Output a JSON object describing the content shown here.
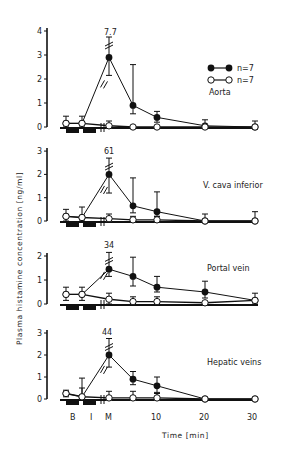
{
  "chart_data": {
    "type": "line",
    "ylabel": "Plasma histamine concentration [ng/ml]",
    "xlabel": "Time [min]",
    "x_tick_labels": [
      "B",
      "I",
      "M",
      "10",
      "20",
      "30"
    ],
    "x": [
      "B1",
      "B2",
      "M",
      "5",
      "10",
      "20",
      "30"
    ],
    "legend": [
      {
        "marker": "filled-circle",
        "label": "n=7"
      },
      {
        "marker": "open-circle",
        "label": "n=7"
      }
    ],
    "panels": [
      {
        "name": "Aorta",
        "ylim": [
          0,
          4
        ],
        "yticks": [
          "0",
          "1",
          "2",
          "3",
          "4"
        ],
        "peak_annotation": "7.7",
        "series": [
          {
            "name": "filled n=7",
            "values": [
              0.15,
              0.15,
              2.9,
              0.9,
              0.4,
              0.05,
              0.0
            ],
            "err_up": [
              0.3,
              0.3,
              0.85,
              1.7,
              0.25,
              0.25,
              0.25
            ],
            "err_down": [
              0.15,
              0.15,
              0.75,
              0.35,
              0.2,
              0.1,
              0.1
            ]
          },
          {
            "name": "open n=7",
            "values": [
              0.15,
              0.15,
              0.05,
              0.0,
              0.0,
              0.0,
              0.0
            ],
            "err_up": [
              0.0,
              0.0,
              0.2,
              0.0,
              0.0,
              0.0,
              0.0
            ],
            "err_down": [
              0.0,
              0.0,
              0.05,
              0.0,
              0.05,
              0.0,
              0.0
            ]
          }
        ]
      },
      {
        "name": "V. cava inferior",
        "ylim": [
          0,
          3
        ],
        "yticks": [
          "0",
          "1",
          "2",
          "3"
        ],
        "peak_annotation": "61",
        "series": [
          {
            "name": "filled n=7",
            "values": [
              0.2,
              0.15,
              2.0,
              0.65,
              0.4,
              0.0,
              0.0
            ],
            "err_up": [
              0.3,
              0.45,
              0.7,
              1.2,
              0.85,
              0.3,
              0.4
            ],
            "err_down": [
              0.2,
              0.15,
              0.8,
              0.3,
              0.2,
              0.05,
              0.05
            ]
          },
          {
            "name": "open n=7",
            "values": [
              0.2,
              0.15,
              0.1,
              0.05,
              0.05,
              0.0,
              0.0
            ],
            "err_up": [
              0.0,
              0.0,
              0.2,
              0.15,
              0.15,
              0.0,
              0.0
            ],
            "err_down": [
              0.0,
              0.0,
              0.1,
              0.05,
              0.05,
              0.0,
              0.0
            ]
          }
        ]
      },
      {
        "name": "Portal vein",
        "ylim": [
          0,
          2
        ],
        "yticks": [
          "0",
          "1",
          "2"
        ],
        "peak_annotation": "34",
        "series": [
          {
            "name": "filled n=7",
            "values": [
              0.4,
              0.4,
              1.45,
              1.15,
              0.7,
              0.5,
              0.15
            ],
            "err_up": [
              0.3,
              0.3,
              0.7,
              0.8,
              0.45,
              0.45,
              0.3
            ],
            "err_down": [
              0.25,
              0.25,
              0.3,
              0.4,
              0.2,
              0.25,
              0.15
            ]
          },
          {
            "name": "open n=7",
            "values": [
              0.4,
              0.4,
              0.2,
              0.1,
              0.1,
              0.05,
              0.15
            ],
            "err_up": [
              0.0,
              0.0,
              0.25,
              0.2,
              0.2,
              0.05,
              0.0
            ],
            "err_down": [
              0.0,
              0.0,
              0.2,
              0.1,
              0.1,
              0.05,
              0.0
            ]
          }
        ]
      },
      {
        "name": "Hepatic veins",
        "ylim": [
          0,
          3
        ],
        "yticks": [
          "0",
          "1",
          "2",
          "3"
        ],
        "peak_annotation": "44",
        "series": [
          {
            "name": "filled n=7",
            "values": [
              0.25,
              0.1,
              2.0,
              0.9,
              0.6,
              0.0,
              0.0
            ],
            "err_up": [
              0.15,
              0.4,
              0.75,
              0.35,
              0.4,
              0.0,
              0.0
            ],
            "err_down": [
              0.15,
              0.1,
              0.55,
              0.25,
              0.3,
              0.0,
              0.0
            ]
          },
          {
            "name": "open n=7",
            "values": [
              0.25,
              0.1,
              0.05,
              0.05,
              0.05,
              0.0,
              0.0
            ],
            "err_up": [
              0.0,
              0.85,
              0.3,
              0.3,
              0.2,
              0.0,
              0.0
            ],
            "err_down": [
              0.0,
              0.1,
              0.05,
              0.05,
              0.05,
              0.0,
              0.0
            ]
          }
        ]
      }
    ]
  },
  "labels": {
    "ylabel": "Plasma histamine concentration [ng/ml]",
    "xlabel": "Time [min]",
    "legend_filled": "n=7",
    "legend_open": "n=7",
    "panel1": "Aorta",
    "panel2": "V. cava inferior",
    "panel3": "Portal vein",
    "panel4": "Hepatic veins",
    "peak1": "7.7",
    "peak2": "61",
    "peak3": "34",
    "peak4": "44",
    "xt_B": "B",
    "xt_I": "I",
    "xt_M": "M",
    "xt_10": "10",
    "xt_20": "20",
    "xt_30": "30"
  }
}
